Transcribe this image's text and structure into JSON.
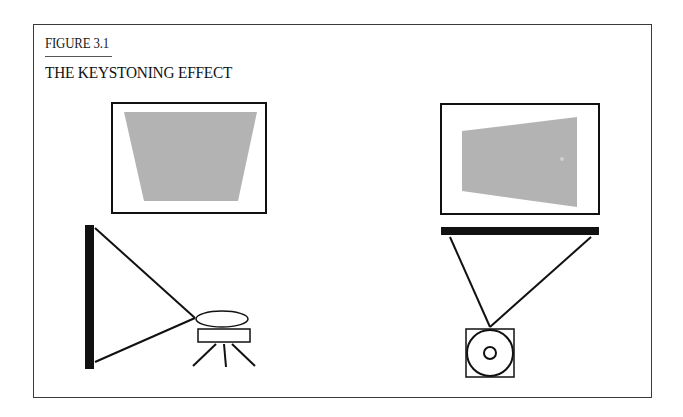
{
  "figure": {
    "label": "FIGURE 3.1",
    "title": "THE KEYSTONING EFFECT"
  },
  "panels": [
    {
      "name": "vertical-keystone",
      "description": "Projector below screen level, tilted upward; image widens at top",
      "screen_image_shape": "trapezoid-wide-top",
      "view": "side"
    },
    {
      "name": "horizontal-keystone",
      "description": "Projector off to the side; image widens on the far side",
      "screen_image_shape": "trapezoid-wide-right",
      "view": "top"
    }
  ],
  "colors": {
    "frame": "#3a3a3a",
    "ink": "#111111",
    "projected_image": "#b3b3b3",
    "background": "#ffffff"
  }
}
